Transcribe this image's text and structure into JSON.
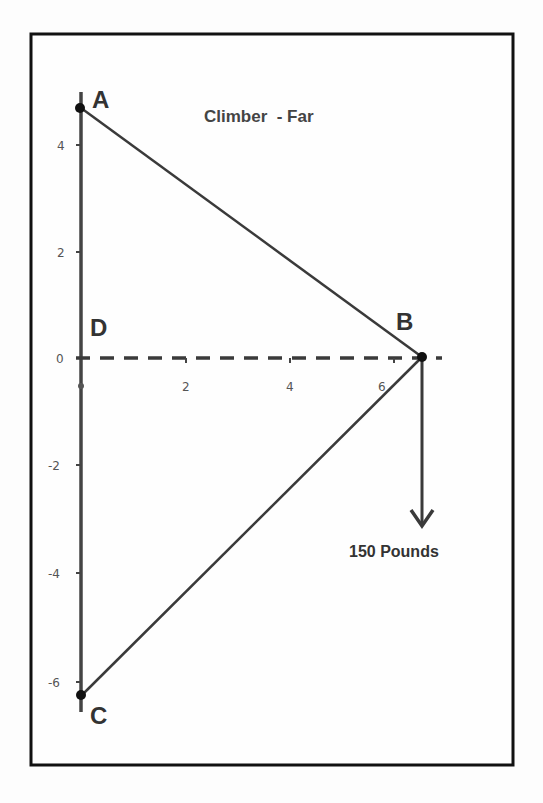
{
  "diagram": {
    "title": "Climber  - Far",
    "points": {
      "A": {
        "label": "A",
        "x": 0,
        "y": 4.7
      },
      "B": {
        "label": "B",
        "x": 6.5,
        "y": 0
      },
      "C": {
        "label": "C",
        "x": 0,
        "y": -6.3
      },
      "D": {
        "label": "D",
        "x": 0,
        "y": 0
      }
    },
    "force_label": "150 Pounds",
    "y_ticks": [
      "4",
      "2",
      "0",
      "-2",
      "-4",
      "-6"
    ],
    "x_ticks": [
      "2",
      "4",
      "6"
    ],
    "colors": {
      "line": "#3a3a3a",
      "frame": "#111111",
      "point": "#111111"
    }
  }
}
